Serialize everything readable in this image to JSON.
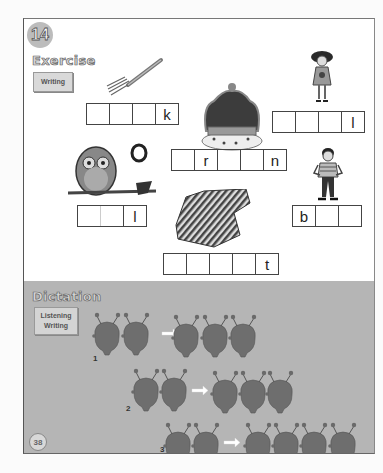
{
  "lesson": {
    "number": "14"
  },
  "exercise": {
    "title": "Exercise",
    "skill": "Writing",
    "items": [
      {
        "picture": "fork",
        "cells": [
          "",
          "",
          "",
          "k"
        ]
      },
      {
        "picture": "crown",
        "cells": [
          "",
          "r",
          "",
          "",
          "n"
        ]
      },
      {
        "picture": "girl",
        "cells": [
          "",
          "",
          "",
          "l"
        ]
      },
      {
        "picture": "owl",
        "cells": [
          "",
          "",
          "l"
        ]
      },
      {
        "picture": "shirt",
        "cells": [
          "",
          "",
          "",
          "",
          "t"
        ]
      },
      {
        "picture": "boy",
        "cells": [
          "b",
          "",
          ""
        ]
      }
    ]
  },
  "dictation": {
    "title": "Dictation",
    "skills": [
      "Listening",
      "Writing"
    ],
    "rows": [
      {
        "number": "1",
        "from_count": 2,
        "to_count": 3
      },
      {
        "number": "2",
        "from_count": 2,
        "to_count": 3
      },
      {
        "number": "3",
        "from_count": 2,
        "to_count": 4
      }
    ]
  },
  "page_number": "38",
  "colors": {
    "panel_gray": "#b5b5b5",
    "head_fill": "#6e6e6e",
    "badge_gray": "#bcbcbc"
  }
}
